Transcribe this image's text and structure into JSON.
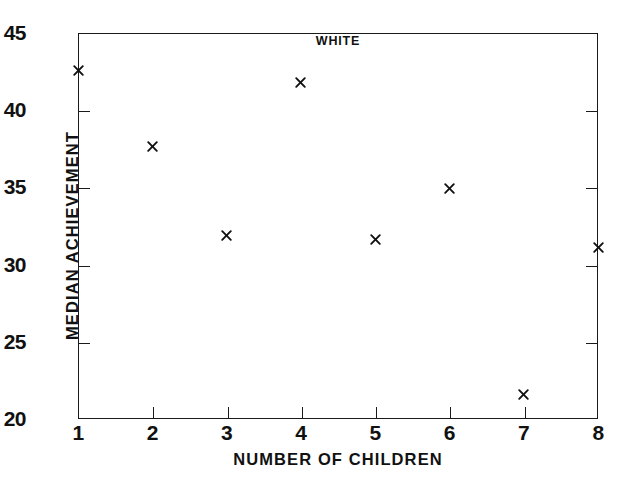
{
  "chart_data": {
    "type": "scatter",
    "title": "WHITE",
    "xlabel": "NUMBER OF CHILDREN",
    "ylabel": "MEDIAN ACHIEVEMENT",
    "xlim": [
      1,
      8
    ],
    "ylim": [
      20,
      45
    ],
    "grid": false,
    "legend": null,
    "marker": "x",
    "marker_color": "#111111",
    "x": [
      1,
      2,
      3,
      4,
      5,
      6,
      7,
      8
    ],
    "values": [
      42.6,
      37.65,
      31.9,
      41.8,
      31.6,
      34.95,
      21.6,
      31.1
    ],
    "points": [
      {
        "x": 1,
        "y": 42.6
      },
      {
        "x": 2,
        "y": 37.65
      },
      {
        "x": 3,
        "y": 31.9
      },
      {
        "x": 4,
        "y": 41.8
      },
      {
        "x": 5,
        "y": 31.6
      },
      {
        "x": 6,
        "y": 34.95
      },
      {
        "x": 7,
        "y": 21.6
      },
      {
        "x": 8,
        "y": 31.1
      }
    ],
    "xticks": [
      1,
      2,
      3,
      4,
      5,
      6,
      7,
      8
    ],
    "xticklabels": [
      "1",
      "2",
      "3",
      "4",
      "5",
      "6",
      "7",
      "8"
    ],
    "yticks": [
      20,
      25,
      30,
      35,
      40,
      45
    ],
    "yticklabels": [
      "20",
      "25",
      "30",
      "35",
      "40",
      "45"
    ],
    "axis_color": "#1a1a1a",
    "background": "#ffffff"
  }
}
